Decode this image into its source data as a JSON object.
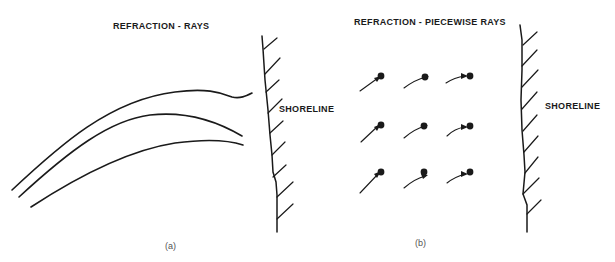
{
  "panel_a": {
    "title": "REFRACTION - RAYS",
    "shoreline_label": "SHORELINE",
    "caption": "(a)"
  },
  "panel_b": {
    "title": "REFRACTION - PIECEWISE RAYS",
    "shoreline_label": "SHORELINE",
    "caption": "(b)",
    "grid": {
      "rows": 3,
      "cols": 3
    }
  },
  "colors": {
    "ink": "#1a1a1a",
    "background": "#ffffff"
  }
}
